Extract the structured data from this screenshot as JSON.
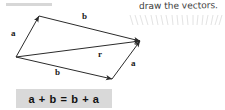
{
  "annotation": {
    "text": "draw the vectors.",
    "color": "#3b3b3b"
  },
  "equation": {
    "text": "a + b = b + a",
    "background": "#d9d9d9",
    "color": "#111111"
  },
  "diagram": {
    "stroke_color": "#2b2b2b",
    "labels": {
      "a_left": "a",
      "b_top": "b",
      "r_diagonal": "r",
      "a_right": "a",
      "b_bottom": "b"
    },
    "vertices": {
      "origin": [
        16,
        57
      ],
      "top_apex": [
        39,
        16
      ],
      "right_apex": [
        140,
        41
      ],
      "bottom_apex": [
        112,
        79
      ]
    },
    "vectors": [
      {
        "name": "a",
        "from": [
          16,
          57
        ],
        "to": [
          39,
          16
        ],
        "label": "a"
      },
      {
        "name": "b",
        "from": [
          39,
          16
        ],
        "to": [
          140,
          41
        ],
        "label": "b"
      },
      {
        "name": "r",
        "from": [
          16,
          57
        ],
        "to": [
          140,
          41
        ],
        "label": "r"
      },
      {
        "name": "b2",
        "from": [
          16,
          57
        ],
        "to": [
          112,
          79
        ],
        "label": "b"
      },
      {
        "name": "a2",
        "from": [
          112,
          79
        ],
        "to": [
          140,
          41
        ],
        "label": "a"
      }
    ]
  },
  "tick_marks": {
    "count": 19,
    "color": "#c2c2c2"
  }
}
